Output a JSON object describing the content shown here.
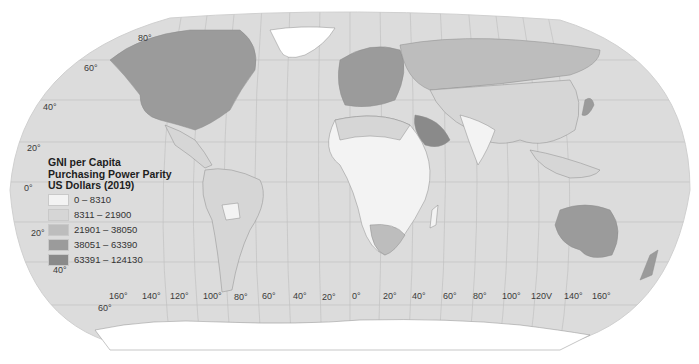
{
  "map": {
    "title": "GNI per Capita Purchasing Power Parity US Dollars (2019)",
    "ocean_color": "#dcdcdc",
    "graticule_color": "#c2c2c2",
    "border_color": "#8c8c8c"
  },
  "legend": {
    "title_lines": [
      "GNI per Capita",
      "Purchasing Power Parity",
      "US Dollars (2019)"
    ],
    "items": [
      {
        "label": "0 – 8310",
        "color": "#f3f3f3"
      },
      {
        "label": "8311 – 21900",
        "color": "#d6d6d6"
      },
      {
        "label": "21901 – 38050",
        "color": "#bdbdbd"
      },
      {
        "label": "38051 – 63390",
        "color": "#9b9b9b"
      },
      {
        "label": "63391 – 124130",
        "color": "#8a8a8a"
      }
    ]
  },
  "latitude_labels": [
    {
      "text": "80°",
      "x": 138,
      "y": 33
    },
    {
      "text": "60°",
      "x": 84,
      "y": 63
    },
    {
      "text": "40°",
      "x": 43,
      "y": 102
    },
    {
      "text": "20°",
      "x": 27,
      "y": 143
    },
    {
      "text": "0°",
      "x": 24,
      "y": 183
    },
    {
      "text": "20°",
      "x": 31,
      "y": 228
    },
    {
      "text": "40°",
      "x": 53,
      "y": 265
    },
    {
      "text": "60°",
      "x": 98,
      "y": 303
    }
  ],
  "longitude_labels": [
    {
      "text": "160°",
      "x": 109,
      "y": 291
    },
    {
      "text": "140°",
      "x": 142,
      "y": 291
    },
    {
      "text": "120°",
      "x": 170,
      "y": 291
    },
    {
      "text": "100°",
      "x": 203,
      "y": 291
    },
    {
      "text": "80°",
      "x": 234,
      "y": 292
    },
    {
      "text": "60°",
      "x": 262,
      "y": 291
    },
    {
      "text": "40°",
      "x": 293,
      "y": 291
    },
    {
      "text": "20°",
      "x": 322,
      "y": 292
    },
    {
      "text": "0°",
      "x": 352,
      "y": 291
    },
    {
      "text": "20°",
      "x": 383,
      "y": 291
    },
    {
      "text": "40°",
      "x": 412,
      "y": 291
    },
    {
      "text": "60°",
      "x": 443,
      "y": 291
    },
    {
      "text": "80°",
      "x": 473,
      "y": 291
    },
    {
      "text": "100°",
      "x": 502,
      "y": 291
    },
    {
      "text": "120V",
      "x": 531,
      "y": 291
    },
    {
      "text": "140°",
      "x": 564,
      "y": 291
    },
    {
      "text": "160°",
      "x": 592,
      "y": 291
    }
  ]
}
